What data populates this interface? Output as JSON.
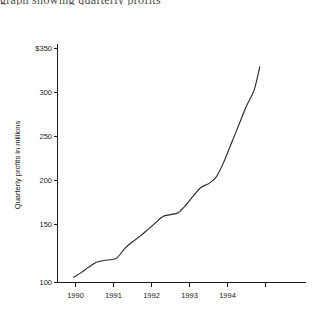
{
  "figure": {
    "clipped_header_text": "graph showing quarterly profits",
    "background": "#ffffff",
    "line_color": "#2b2b2b",
    "axis_color": "#1a1a1a"
  },
  "chart_data": {
    "type": "line",
    "title": "",
    "xlabel": "",
    "ylabel": "Quarterly profits in millions",
    "ylim": [
      100,
      350
    ],
    "xlim": [
      1989.75,
      1995.0
    ],
    "grid": false,
    "legend": false,
    "y_ticks": [
      100,
      150,
      200,
      250,
      300,
      350
    ],
    "y_tick_labels": [
      "100",
      "150",
      "200",
      "250",
      "300",
      "$350"
    ],
    "x_ticks": [
      1990,
      1991,
      1992,
      1993,
      1994
    ],
    "x_tick_labels": [
      "1990",
      "1991",
      "1992",
      "1993",
      "1994"
    ],
    "x_minor_ticks": [
      1990.5,
      1991.5,
      1992.5,
      1993.5,
      1994.5
    ],
    "series": [
      {
        "name": "Quarterly profits",
        "x": [
          1989.95,
          1990.15,
          1990.35,
          1990.55,
          1990.75,
          1990.95,
          1991.1,
          1991.3,
          1991.5,
          1991.7,
          1991.9,
          1992.1,
          1992.3,
          1992.5,
          1992.7,
          1992.9,
          1993.1,
          1993.3,
          1993.5,
          1993.7,
          1993.9,
          1994.1,
          1994.3,
          1994.5,
          1994.7,
          1994.85
        ],
        "y": [
          105,
          110,
          116,
          121,
          123,
          124,
          126,
          136,
          143,
          149,
          156,
          163,
          170,
          172,
          174,
          182,
          192,
          201,
          205,
          212,
          228,
          248,
          268,
          288,
          305,
          330
        ]
      }
    ],
    "units": "millions of dollars",
    "currency_symbol": "$"
  }
}
